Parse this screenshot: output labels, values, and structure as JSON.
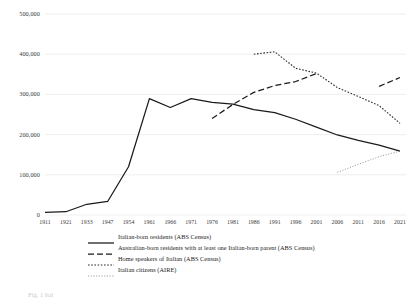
{
  "chart_data": {
    "type": "line",
    "title": "",
    "xlabel": "",
    "ylabel": "",
    "ylim": [
      0,
      500000
    ],
    "ytick_values": [
      0,
      100000,
      200000,
      300000,
      400000,
      500000
    ],
    "ytick_labels": [
      "0",
      "100,000",
      "200,000",
      "300,000",
      "400,000",
      "500,000"
    ],
    "grid": "horizontal",
    "legend_position": "below-axes",
    "categories": [
      "1911",
      "1921",
      "1933",
      "1947",
      "1954",
      "1961",
      "1966",
      "1971",
      "1976",
      "1981",
      "1986",
      "1991",
      "1996",
      "2001",
      "2006",
      "2011",
      "2016",
      "2021"
    ],
    "series": [
      {
        "name": "Italian-born residents  (ABS Census)",
        "style": "solid",
        "values": [
          6700,
          8100,
          26700,
          33600,
          119900,
          289500,
          267300,
          289500,
          280200,
          275900,
          261900,
          254800,
          238200,
          218700,
          199100,
          185400,
          174000,
          159000
        ]
      },
      {
        "name": "Australian-born residents with at least one Italian-born parent  (ABS Census)",
        "style": "dashed",
        "values": [
          null,
          null,
          null,
          null,
          null,
          null,
          null,
          null,
          240000,
          275000,
          305000,
          322000,
          332000,
          352000,
          null,
          null,
          320000,
          342000
        ]
      },
      {
        "name": "Home speakers of Italian (ABS Census)",
        "style": "dotted-dense",
        "values": [
          null,
          null,
          null,
          null,
          null,
          null,
          null,
          null,
          null,
          null,
          400000,
          406000,
          365000,
          353000,
          317000,
          295000,
          272000,
          228000
        ]
      },
      {
        "name": "Italian citizens (AIRE)",
        "style": "dotted-fine",
        "values": [
          null,
          null,
          null,
          null,
          null,
          null,
          null,
          null,
          null,
          null,
          null,
          null,
          null,
          null,
          106000,
          126000,
          145000,
          159000
        ]
      }
    ]
  },
  "legend": {
    "items": [
      {
        "label": "Italian-born residents   (ABS Census)",
        "style": "solid"
      },
      {
        "label": "Australian-born residents with at least one Italian-born parent  (ABS Census)",
        "style": "dashed"
      },
      {
        "label": "Home speakers of Italian (ABS Census)",
        "style": "dotted-dense"
      },
      {
        "label": "Italian citizens (AIRE)",
        "style": "dotted-fine"
      }
    ]
  },
  "caption": {
    "text": "Fig. 1 Ital"
  },
  "colors": {
    "line": "#1a1a1a",
    "grid": "#e8e8e8",
    "text": "#3a3a3a",
    "background": "#ffffff"
  }
}
